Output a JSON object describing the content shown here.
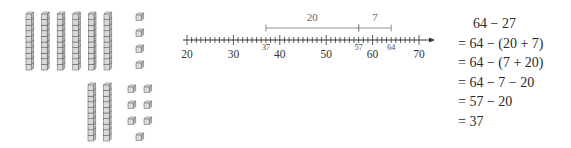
{
  "base_ten_blocks": {
    "minuend": {
      "value": 64,
      "tens": 6,
      "ones": 4
    },
    "subtrahend": {
      "value": 27,
      "tens": 2,
      "ones": 7
    },
    "colors": {
      "fill": "#d9d9d9",
      "stroke": "#555555"
    }
  },
  "number_line": {
    "min": 20,
    "max": 70,
    "minor_step": 1,
    "major_step": 10,
    "major_labels": [
      "20",
      "30",
      "40",
      "50",
      "60",
      "70"
    ],
    "marked_points": [
      {
        "value": 37,
        "label": "37"
      },
      {
        "value": 57,
        "label": "57"
      },
      {
        "value": 64,
        "label": "64"
      }
    ],
    "jumps": [
      {
        "from": 37,
        "to": 57,
        "label": "20"
      },
      {
        "from": 57,
        "to": 64,
        "label": "7"
      }
    ],
    "colors": {
      "axis": "#333333",
      "bracket": "#777777"
    }
  },
  "equations": {
    "lines": [
      "64 − 27",
      "= 64 − (20 + 7)",
      "= 64 − (7 + 20)",
      "= 64 − 7 − 20",
      "= 57 − 20",
      "= 37"
    ]
  }
}
